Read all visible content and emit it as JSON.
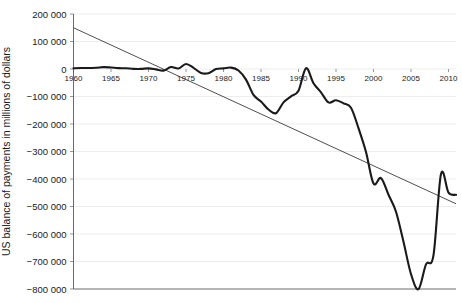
{
  "chart_data": {
    "type": "line",
    "title": "",
    "xlabel": "",
    "ylabel": "US balance of payments in millions of dollars",
    "xlim": [
      1960,
      2011
    ],
    "ylim": [
      -800000,
      200000
    ],
    "grid": true,
    "legend": "none",
    "xticks": [
      "1960",
      "1965",
      "1970",
      "1975",
      "1980",
      "1985",
      "1990",
      "1995",
      "2000",
      "2005",
      "2010"
    ],
    "yticks": [
      "200 000",
      "100 000",
      "0",
      "−100 000",
      "−200 000",
      "−300 000",
      "−400 000",
      "−500 000",
      "−600 000",
      "−700 000",
      "−800 000"
    ],
    "ytick_values": [
      200000,
      100000,
      0,
      -100000,
      -200000,
      -300000,
      -400000,
      -500000,
      -600000,
      -700000,
      -800000
    ],
    "xtick_values": [
      1960,
      1965,
      1970,
      1975,
      1980,
      1985,
      1990,
      1995,
      2000,
      2005,
      2010
    ],
    "series": [
      {
        "name": "US balance of payments",
        "color": "#1a1a1a",
        "x": [
          1960,
          1961,
          1962,
          1963,
          1964,
          1965,
          1966,
          1967,
          1968,
          1969,
          1970,
          1971,
          1972,
          1973,
          1974,
          1975,
          1976,
          1977,
          1978,
          1979,
          1980,
          1981,
          1982,
          1983,
          1984,
          1985,
          1986,
          1987,
          1988,
          1989,
          1990,
          1991,
          1992,
          1993,
          1994,
          1995,
          1996,
          1997,
          1998,
          1999,
          2000,
          2001,
          2002,
          2003,
          2004,
          2005,
          2006,
          2007,
          2008,
          2009,
          2010,
          2011
        ],
        "values": [
          2800,
          3800,
          3400,
          4400,
          6800,
          5400,
          3000,
          2600,
          600,
          400,
          2300,
          -1400,
          -5800,
          7100,
          2000,
          18100,
          4200,
          -14300,
          -15100,
          -285,
          2300,
          5000,
          -5500,
          -38700,
          -94300,
          -118200,
          -147200,
          -160700,
          -121200,
          -99500,
          -79000,
          2900,
          -51600,
          -84800,
          -121600,
          -113600,
          -124800,
          -140700,
          -215100,
          -301600,
          -416300,
          -396600,
          -457200,
          -519100,
          -628500,
          -745800,
          -800600,
          -710300,
          -677100,
          -381900,
          -449500,
          -457700
        ]
      },
      {
        "name": "Linear trend",
        "color": "#3a3a3a",
        "x": [
          1960,
          2011
        ],
        "values": [
          150000,
          -490000
        ]
      }
    ],
    "annotations": []
  }
}
